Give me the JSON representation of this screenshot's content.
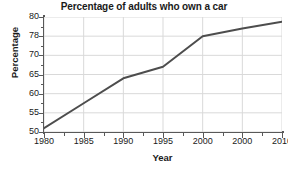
{
  "chart_data": {
    "type": "line",
    "title": "Percentage of adults who own a car",
    "xlabel": "Year",
    "ylabel": "Percentage",
    "grid": true,
    "legend": false,
    "x": [
      1980,
      1985,
      1990,
      1995,
      2000,
      2005,
      2010
    ],
    "values": [
      51,
      57.5,
      64,
      67,
      78,
      78.8,
      79.5
    ],
    "series": [
      {
        "name": "Percentage of adults who own a car",
        "values": [
          51,
          57.5,
          64,
          67,
          78,
          78.8,
          79.5
        ],
        "color": "#4d4d4d"
      }
    ],
    "xticklabels": [
      "1980",
      "1985",
      "1990",
      "1995",
      "2000",
      "2000",
      "2010"
    ],
    "xtickvalues": [
      1980,
      1985,
      1990,
      1995,
      2000,
      2005,
      2010
    ],
    "yticklabels": [
      "50",
      "55",
      "60",
      "65",
      "70",
      "78",
      "80"
    ],
    "ytickvalues": [
      50,
      55,
      60,
      65,
      70,
      78,
      80
    ],
    "xlim": [
      1980,
      2010
    ],
    "ylim": [
      50,
      80
    ],
    "note": "Y axis ticks are non-uniformly labelled (70 then 78 then 80); the sixth x tick is labelled 2000 (duplicate of the fifth)."
  },
  "colors": {
    "line": "#4d4d4d",
    "grid": "#d9d9d9",
    "axis": "#595959",
    "text": "#1a1a1a",
    "background": "#ffffff"
  }
}
